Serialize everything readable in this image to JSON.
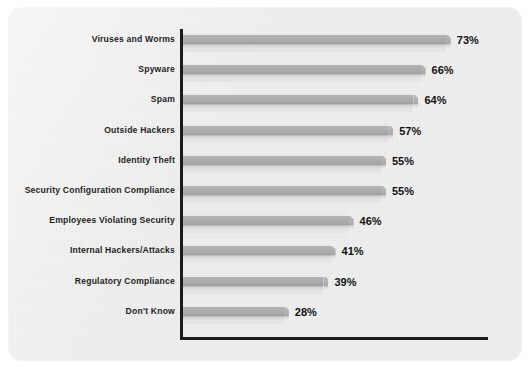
{
  "chart_data": {
    "type": "bar",
    "orientation": "horizontal",
    "title": "",
    "subtitle": "",
    "xlabel": "",
    "ylabel": "",
    "xlim": [
      0,
      100
    ],
    "grid": false,
    "legend": null,
    "value_suffix": "%",
    "categories": [
      "Viruses and Worms",
      "Spyware",
      "Spam",
      "Outside Hackers",
      "Identity Theft",
      "Security Configuration Compliance",
      "Employees Violating Security",
      "Internal Hackers/Attacks",
      "Regulatory Compliance",
      "Don't Know"
    ],
    "values": [
      73,
      66,
      64,
      57,
      55,
      55,
      46,
      41,
      39,
      28
    ],
    "data_labels": [
      "73%",
      "66%",
      "64%",
      "57%",
      "55%",
      "55%",
      "46%",
      "41%",
      "39%",
      "28%"
    ],
    "colors": {
      "background": "#eeeeee",
      "bar_fill": "#a8a8a8",
      "bar_highlight": "#e9e9e9",
      "bar_shadow": "#9e9e9e",
      "axis": "#1b1b1b",
      "label_text": "#1d1d1d",
      "value_text": "#111111"
    }
  }
}
